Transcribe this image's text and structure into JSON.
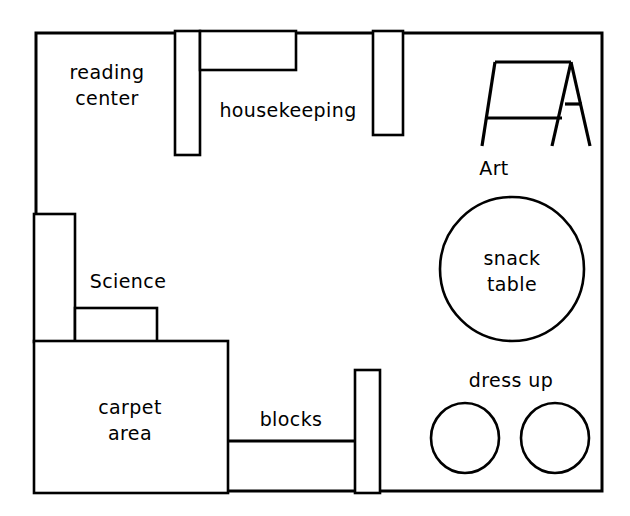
{
  "diagram": {
    "background_color": "#ffffff",
    "line_color": "#000000",
    "canvas": {
      "width": 630,
      "height": 516
    },
    "room_outline": {
      "x": 36,
      "y": 33,
      "width": 566,
      "height": 458
    }
  },
  "labels": {
    "reading_center_line1": "reading",
    "reading_center_line2": "center",
    "housekeeping": "housekeeping",
    "art": "Art",
    "snack_table_line1": "snack",
    "snack_table_line2": "table",
    "science": "Science",
    "carpet_area_line1": "carpet",
    "carpet_area_line2": "area",
    "blocks": "blocks",
    "dress_up": "dress up"
  },
  "areas": [
    {
      "name": "reading center",
      "label": "reading center",
      "shape": "open-corner",
      "position": "top-left"
    },
    {
      "name": "housekeeping",
      "label": "housekeeping",
      "shape": "partitioned",
      "position": "top-center"
    },
    {
      "name": "art",
      "label": "Art",
      "shape": "easel",
      "position": "top-right"
    },
    {
      "name": "snack table",
      "label": "snack table",
      "shape": "circle",
      "position": "middle-right"
    },
    {
      "name": "science",
      "label": "Science",
      "shape": "stepped-shelf",
      "position": "middle-left"
    },
    {
      "name": "carpet area",
      "label": "carpet area",
      "shape": "rectangle",
      "position": "bottom-left"
    },
    {
      "name": "blocks",
      "label": "blocks",
      "shape": "open-bay",
      "position": "bottom-center"
    },
    {
      "name": "dress up",
      "label": "dress up",
      "shape": "two-circles",
      "position": "bottom-right"
    }
  ],
  "shapes": {
    "housekeeping_vertical_partition": {
      "x": 175,
      "y": 33,
      "width": 25,
      "height": 122
    },
    "housekeeping_shelf": {
      "x": 200,
      "y": 33,
      "width": 96,
      "height": 37
    },
    "housekeeping_right_partition": {
      "x": 373,
      "y": 33,
      "width": 30,
      "height": 102
    },
    "science_tall_shelf": {
      "x": 36,
      "y": 214,
      "width": 39,
      "height": 126
    },
    "science_low_shelf": {
      "x": 75,
      "y": 308,
      "width": 82,
      "height": 32
    },
    "carpet_rect": {
      "x": 36,
      "y": 341,
      "width": 192,
      "height": 150
    },
    "carpet_blocks_divider": {
      "x1": 228,
      "y1": 441,
      "x2": 355,
      "y2": 441
    },
    "blocks_partition": {
      "x": 355,
      "y": 370,
      "width": 25,
      "height": 121
    },
    "snack_table_circle": {
      "cx": 512,
      "cy": 269,
      "r": 72
    },
    "dress_up_circle_left": {
      "cx": 465,
      "cy": 438,
      "rx": 34,
      "ry": 35
    },
    "dress_up_circle_right": {
      "cx": 555,
      "cy": 438,
      "rx": 34,
      "ry": 35
    },
    "easel": {
      "top_left": {
        "x": 495,
        "y": 62
      },
      "top_right": {
        "x": 571,
        "y": 62
      },
      "left_foot": {
        "x": 482,
        "y": 146
      },
      "middle_foot": {
        "x": 552,
        "y": 146
      },
      "right_foot": {
        "x": 590,
        "y": 146
      },
      "left_rail_y": 118,
      "right_rail_y": 104
    }
  }
}
